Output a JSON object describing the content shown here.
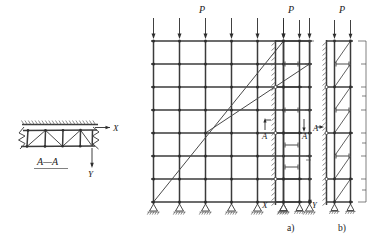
{
  "figure": {
    "title": "",
    "background_color": "#ffffff",
    "line_color": "#3b3b3b"
  },
  "section_view": {
    "label": "A—A",
    "axis_x_label": "X",
    "axis_y_label": "Y",
    "truss": {
      "panels": 4,
      "diagonal_pattern": "zigzag",
      "verticals": 3,
      "break_lines": 2,
      "top_hatch_marks": 22
    }
  },
  "main_frame": {
    "load_label": "P",
    "load_arrow_count": 7,
    "columns": 7,
    "floors": 7,
    "support_count": 7,
    "support_type": "pin",
    "diagonal_braces": [
      {
        "from": "bottom-left",
        "to": "top-right",
        "span": "full"
      },
      {
        "from": "mid-left",
        "to": "top-right",
        "span": "partial"
      }
    ],
    "node_count": 56
  },
  "scheme_a": {
    "caption": "a)",
    "load_label": "P",
    "load_arrow_count": 2,
    "columns": 2,
    "levels": 7,
    "section_marker_label": "A",
    "axis_x_label": "X",
    "axis_y_label": "Y",
    "wall_type": "fixed-hatched",
    "brace_type": "horizontal-struts",
    "strut_count": 6,
    "support_count": 2,
    "support_type": "pin"
  },
  "scheme_b": {
    "caption": "b)",
    "load_label": "P",
    "load_arrow_count": 2,
    "columns": 2,
    "levels": 7,
    "section_marker_label": "A",
    "wall_type": "fixed-hatched",
    "brace_type": "diagonal-and-struts",
    "diagonal_count": 6,
    "strut_count": 6,
    "support_count": 2,
    "support_type": "pin",
    "dimension_ticks": 7
  }
}
